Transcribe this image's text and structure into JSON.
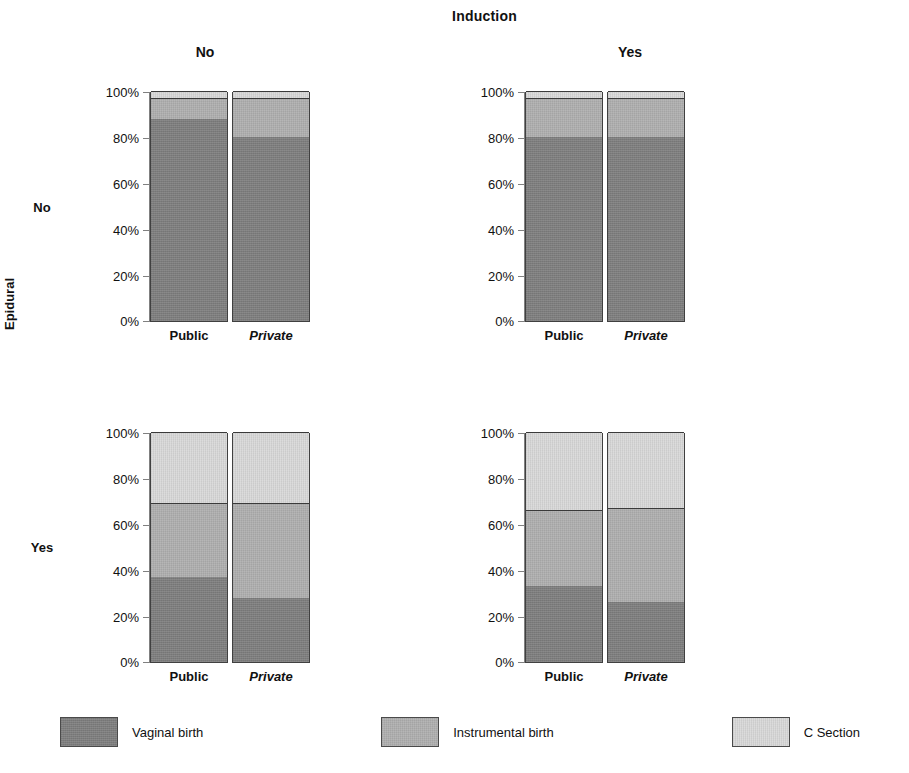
{
  "figure": {
    "top_title": "Induction",
    "column_headers": [
      "No",
      "Yes"
    ],
    "row_axis_title": "Epidural",
    "row_headers": [
      "No",
      "Yes"
    ],
    "x_tick_labels": [
      "Public",
      "Private"
    ],
    "y_tick_labels": [
      "0%",
      "20%",
      "40%",
      "60%",
      "80%",
      "100%"
    ]
  },
  "legend": {
    "items": [
      {
        "label": "Vaginal birth",
        "color": "#7d7d7d"
      },
      {
        "label": "Instrumental birth",
        "color": "#aeaeae"
      },
      {
        "label": "C Section",
        "color": "#d8d8d8"
      }
    ]
  },
  "chart_data": {
    "type": "bar",
    "title": "Induction",
    "subtitle": "Mode of birth by epidural use, induction and hospital booking type",
    "xlabel": "",
    "ylabel": "",
    "ylim": [
      0,
      100
    ],
    "grid": false,
    "stacked": true,
    "legend_position": "bottom",
    "facet_rows_variable": "Epidural",
    "facet_cols_variable": "Induction",
    "categories": [
      "Public",
      "Private"
    ],
    "series_names": [
      "Vaginal birth",
      "Instrumental birth",
      "C Section"
    ],
    "panels": [
      {
        "id": "panel-00",
        "induction": "No",
        "epidural": "No",
        "bars": [
          {
            "category": "Public",
            "vaginal": 88,
            "instrumental": 9,
            "csection": 3
          },
          {
            "category": "Private",
            "vaginal": 80,
            "instrumental": 17,
            "csection": 3
          }
        ]
      },
      {
        "id": "panel-01",
        "induction": "Yes",
        "epidural": "No",
        "bars": [
          {
            "category": "Public",
            "vaginal": 80,
            "instrumental": 17,
            "csection": 3
          },
          {
            "category": "Private",
            "vaginal": 80,
            "instrumental": 17,
            "csection": 3
          }
        ]
      },
      {
        "id": "panel-10",
        "induction": "No",
        "epidural": "Yes",
        "bars": [
          {
            "category": "Public",
            "vaginal": 37,
            "instrumental": 32,
            "csection": 31
          },
          {
            "category": "Private",
            "vaginal": 28,
            "instrumental": 41,
            "csection": 31
          }
        ]
      },
      {
        "id": "panel-11",
        "induction": "Yes",
        "epidural": "Yes",
        "bars": [
          {
            "category": "Public",
            "vaginal": 33,
            "instrumental": 33,
            "csection": 34
          },
          {
            "category": "Private",
            "vaginal": 26,
            "instrumental": 41,
            "csection": 33
          }
        ]
      }
    ],
    "y_ticks": [
      0,
      20,
      40,
      60,
      80,
      100
    ],
    "y_tick_labels": [
      "0%",
      "20%",
      "40%",
      "60%",
      "80%",
      "100%"
    ]
  }
}
